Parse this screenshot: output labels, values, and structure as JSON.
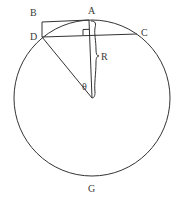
{
  "diagram": {
    "labels": {
      "A": "A",
      "B": "B",
      "C": "C",
      "D": "D",
      "G": "G",
      "R": "R",
      "theta": "θ"
    },
    "colors": {
      "stroke": "#333333",
      "text": "#3a3a3a",
      "background": "#ffffff"
    },
    "circle": {
      "cx": 92,
      "cy": 98,
      "r": 78
    },
    "points": {
      "A": [
        89,
        20
      ],
      "B": [
        42,
        22
      ],
      "C": [
        137,
        34
      ],
      "D": [
        42,
        37
      ],
      "O": [
        92,
        98
      ]
    }
  }
}
